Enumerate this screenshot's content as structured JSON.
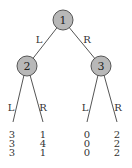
{
  "tree": {
    "nodes": [
      {
        "id": "1",
        "label": "1"
      },
      {
        "id": "2",
        "label": "2"
      },
      {
        "id": "3",
        "label": "3"
      }
    ],
    "edges": {
      "root_left": "L",
      "root_right": "R",
      "n2_left": "L",
      "n2_right": "R",
      "n3_left": "L",
      "n3_right": "R"
    },
    "payoffs": [
      [
        "3",
        "3",
        "3"
      ],
      [
        "1",
        "4",
        "1"
      ],
      [
        "0",
        "0",
        "0"
      ],
      [
        "2",
        "2",
        "2"
      ]
    ],
    "colors": {
      "node_fill": "#b8b8b8",
      "line": "#555555"
    }
  }
}
